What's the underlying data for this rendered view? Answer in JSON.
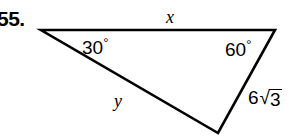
{
  "figure": {
    "problem_number": "55.",
    "shape": "triangle",
    "background_color": "#ffffff",
    "stroke_color": "#000000",
    "vertices": {
      "top_left": {
        "x": 41,
        "y": 30
      },
      "top_right": {
        "x": 275,
        "y": 30
      },
      "bottom": {
        "x": 218,
        "y": 133
      }
    },
    "labels": {
      "top_side": "x",
      "left_side": "y",
      "angle_left": "30",
      "angle_right": "60",
      "degree_symbol": "°",
      "right_side_coefficient": "6",
      "right_side_radical_symbol": "√",
      "right_side_radicand": "3"
    }
  }
}
